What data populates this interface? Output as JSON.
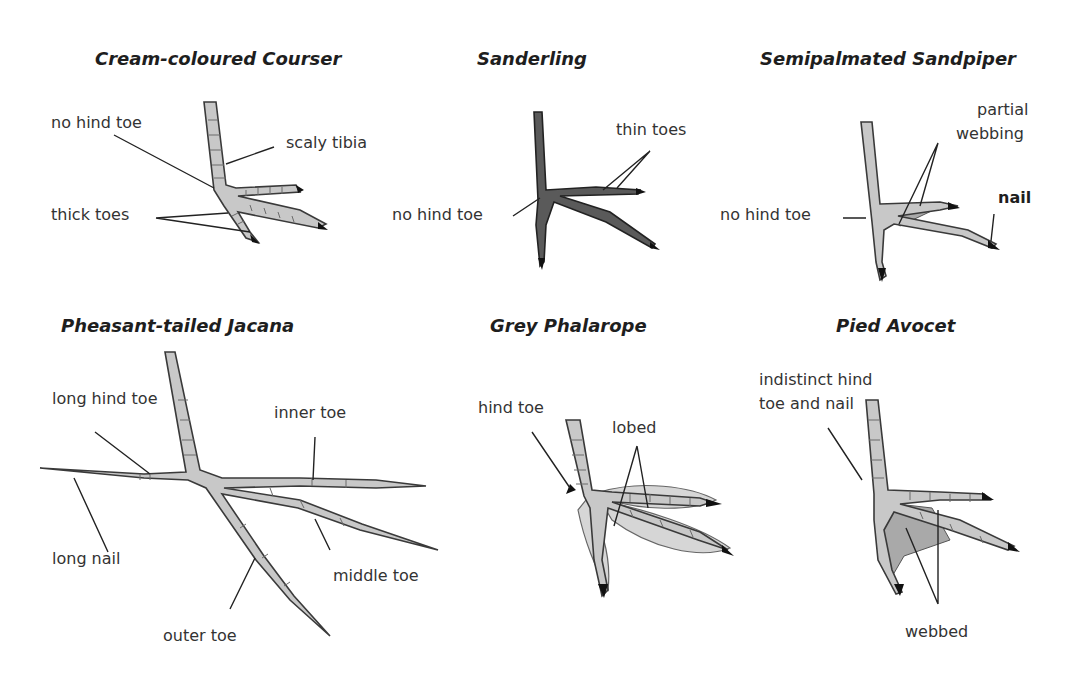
{
  "panels": [
    {
      "species": "Cream-coloured Courser",
      "labels": [
        "no hind toe",
        "scaly tibia",
        "thick toes"
      ]
    },
    {
      "species": "Sanderling",
      "labels": [
        "thin toes",
        "no hind toe"
      ]
    },
    {
      "species": "Semipalmated Sandpiper",
      "labels": [
        "partial",
        "webbing",
        "no hind toe",
        "nail"
      ]
    },
    {
      "species": "Pheasant-tailed Jacana",
      "labels": [
        "long hind toe",
        "inner toe",
        "long nail",
        "middle toe",
        "outer toe"
      ]
    },
    {
      "species": "Grey Phalarope",
      "labels": [
        "hind toe",
        "lobed"
      ]
    },
    {
      "species": "Pied Avocet",
      "labels": [
        "indistinct hind",
        "toe and nail",
        "webbed"
      ]
    }
  ]
}
